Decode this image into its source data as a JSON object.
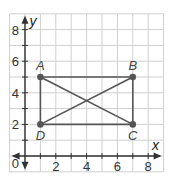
{
  "axes": {
    "x_label": "x",
    "y_label": "y",
    "origin_label": "0",
    "x_ticks": [
      "2",
      "4",
      "6",
      "8"
    ],
    "y_ticks": [
      "2",
      "4",
      "6",
      "8"
    ],
    "x_range": [
      -1,
      9
    ],
    "y_range": [
      -1,
      9
    ]
  },
  "points": [
    {
      "name": "A",
      "x": 1,
      "y": 5
    },
    {
      "name": "B",
      "x": 7,
      "y": 5
    },
    {
      "name": "C",
      "x": 7,
      "y": 2
    },
    {
      "name": "D",
      "x": 1,
      "y": 2
    }
  ],
  "segments": [
    [
      "A",
      "B"
    ],
    [
      "B",
      "C"
    ],
    [
      "C",
      "D"
    ],
    [
      "D",
      "A"
    ],
    [
      "A",
      "C"
    ],
    [
      "B",
      "D"
    ]
  ],
  "colors": {
    "grid": "#cfcfcf",
    "axis": "#333333",
    "shape": "#555555",
    "point": "#555555"
  }
}
